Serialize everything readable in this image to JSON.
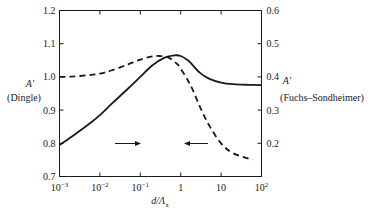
{
  "chart_data": {
    "type": "line",
    "title": "",
    "xlabel": "d/Λ_x",
    "xlabel_parts": {
      "main": "d/Λ",
      "sub": "x"
    },
    "xscale": "log",
    "xlim": [
      0.001,
      100
    ],
    "x_ticks": [
      0.001,
      0.01,
      0.1,
      1,
      10,
      100
    ],
    "x_tick_labels": [
      {
        "base": "10",
        "exp": "−3"
      },
      {
        "base": "10",
        "exp": "−2"
      },
      {
        "base": "10",
        "exp": "−1"
      },
      {
        "base": "1",
        "exp": ""
      },
      {
        "base": "10",
        "exp": ""
      },
      {
        "base": "10",
        "exp": "2"
      }
    ],
    "ylabel_left": {
      "symbol": "A′",
      "name": "(Dingle)"
    },
    "ylim_left": [
      0.7,
      1.2
    ],
    "y_ticks_left": [
      "0.7",
      "0.8",
      "0.9",
      "1.0",
      "1.1",
      "1.2"
    ],
    "ylabel_right": {
      "symbol": "A′",
      "name": "(Fuchs–Sondheimer)"
    },
    "ylim_right": [
      0.1,
      0.6
    ],
    "y_ticks_right": [
      "0.2",
      "0.3",
      "0.4",
      "0.5",
      "0.6"
    ],
    "grid": false,
    "legend": "none (arrows indicate axis association)",
    "series": [
      {
        "name": "Dingle",
        "axis": "left",
        "style": "solid",
        "x": [
          0.001,
          0.002,
          0.005,
          0.01,
          0.02,
          0.05,
          0.1,
          0.2,
          0.4,
          0.7,
          1,
          1.5,
          2,
          3,
          5,
          10,
          20,
          50,
          100
        ],
        "y": [
          0.795,
          0.82,
          0.855,
          0.885,
          0.92,
          0.965,
          1.0,
          1.035,
          1.058,
          1.065,
          1.063,
          1.05,
          1.035,
          1.012,
          0.995,
          0.983,
          0.978,
          0.976,
          0.975
        ]
      },
      {
        "name": "Fuchs–Sondheimer",
        "axis": "right",
        "style": "dashed",
        "x": [
          0.001,
          0.002,
          0.005,
          0.01,
          0.02,
          0.05,
          0.1,
          0.2,
          0.3,
          0.5,
          0.8,
          1,
          1.5,
          2,
          3,
          5,
          10,
          20,
          60
        ],
        "y": [
          0.4,
          0.401,
          0.405,
          0.41,
          0.42,
          0.438,
          0.452,
          0.462,
          0.463,
          0.458,
          0.44,
          0.425,
          0.39,
          0.36,
          0.31,
          0.255,
          0.2,
          0.17,
          0.15
        ]
      }
    ],
    "annotations": [
      {
        "type": "arrow",
        "direction": "right",
        "at_x": 0.03,
        "at_y_left": 0.885,
        "meaning": "solid curve reads on right axis"
      },
      {
        "type": "arrow",
        "direction": "left",
        "at_x": 2.5,
        "at_y_left": 0.885,
        "meaning": "dashed curve reads on left axis"
      }
    ]
  }
}
